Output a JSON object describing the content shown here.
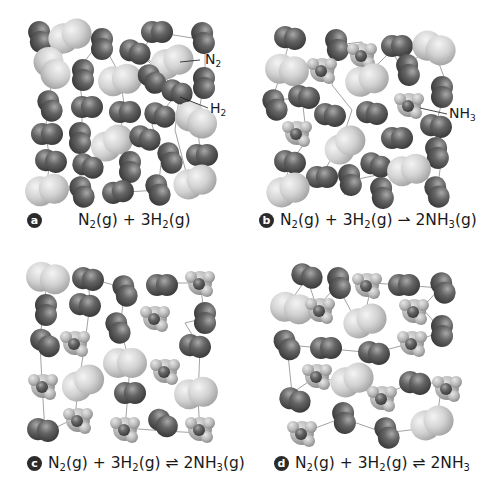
{
  "figure": {
    "colors": {
      "h2_dark": "#5c5c5c",
      "n2_light": "#d4d4d4",
      "nh3_mid": "#bdbdbd",
      "path_line": "#8a8a8a",
      "text": "#1a1a1a",
      "badge": "#2b2b2b"
    },
    "legend": {
      "n2_label": "N",
      "n2_sub": "2",
      "h2_label": "H",
      "h2_sub": "2",
      "nh3_label": "NH",
      "nh3_sub": "3"
    },
    "panels": [
      {
        "id": "a",
        "badge": "a",
        "equation": {
          "r1": "N",
          "r1s": "2",
          "r1p": "(g) + 3H",
          "r2s": "2",
          "r2p": "(g)",
          "arrow": "",
          "p": "",
          "ps": "",
          "pp": ""
        }
      },
      {
        "id": "b",
        "badge": "b",
        "equation": {
          "r1": "N",
          "r1s": "2",
          "r1p": "(g) + 3H",
          "r2s": "2",
          "r2p": "(g) ",
          "arrow": "⇀",
          "p": " 2NH",
          "ps": "3",
          "pp": "(g)"
        }
      },
      {
        "id": "c",
        "badge": "c",
        "equation": {
          "r1": "N",
          "r1s": "2",
          "r1p": "(g) + 3H",
          "r2s": "2",
          "r2p": "(g) ",
          "arrow": "⇌",
          "p": " 2NH",
          "ps": "3",
          "pp": "(g)"
        }
      },
      {
        "id": "d",
        "badge": "d",
        "equation": {
          "r1": "N",
          "r1s": "2",
          "r1p": "(g) + 3H",
          "r2s": "2",
          "r2p": "(g) ",
          "arrow": "⇌",
          "p": " 2NH",
          "ps": "3",
          "pp": ""
        }
      }
    ]
  }
}
